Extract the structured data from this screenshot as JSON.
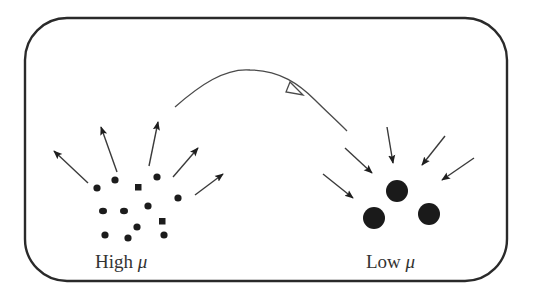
{
  "diagram": {
    "labels": {
      "high": {
        "text": "High ",
        "symbol": "μ"
      },
      "low": {
        "text": "Low ",
        "symbol": "μ"
      }
    },
    "transition": {
      "from": "high",
      "to": "low",
      "description": "curved transfer arrow with hollow arrowhead"
    },
    "high_group": {
      "particle_count": 13,
      "particle_size": "small",
      "arrow_direction": "outward",
      "arrow_count": 5
    },
    "low_group": {
      "particle_count": 3,
      "particle_size": "large",
      "arrow_direction": "inward",
      "arrow_count": 5
    },
    "colors": {
      "stroke": "#2a2a2a",
      "fill": "#1c1c1c",
      "background": "#ffffff"
    }
  }
}
